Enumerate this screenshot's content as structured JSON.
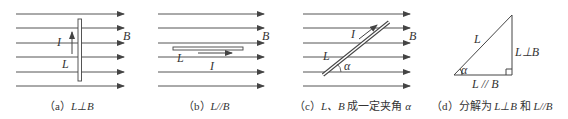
{
  "figure": {
    "panels": [
      {
        "id": "a",
        "caption_prefix": "（a）",
        "caption_math": "L⊥B",
        "labels": {
          "current": "I",
          "length": "L",
          "field": "B"
        }
      },
      {
        "id": "b",
        "caption_prefix": "（b）",
        "caption_math": "L//B",
        "labels": {
          "current": "I",
          "length": "L",
          "field": "B"
        }
      },
      {
        "id": "c",
        "caption_prefix": "（c）",
        "caption_math": "L、B",
        "caption_text": " 成一定夹角 ",
        "caption_angle": "α",
        "labels": {
          "current": "I",
          "length": "L",
          "field": "B",
          "angle": "α"
        }
      },
      {
        "id": "d",
        "caption_prefix": "（d）分解为 ",
        "caption_math1": "L⊥B",
        "caption_text": " 和 ",
        "caption_math2": "L//B",
        "labels": {
          "hypotenuse": "L",
          "vertical": "L⊥B",
          "horizontal": "L // B",
          "angle": "α"
        }
      }
    ],
    "colors": {
      "line": "#444444",
      "text": "#333333"
    }
  }
}
